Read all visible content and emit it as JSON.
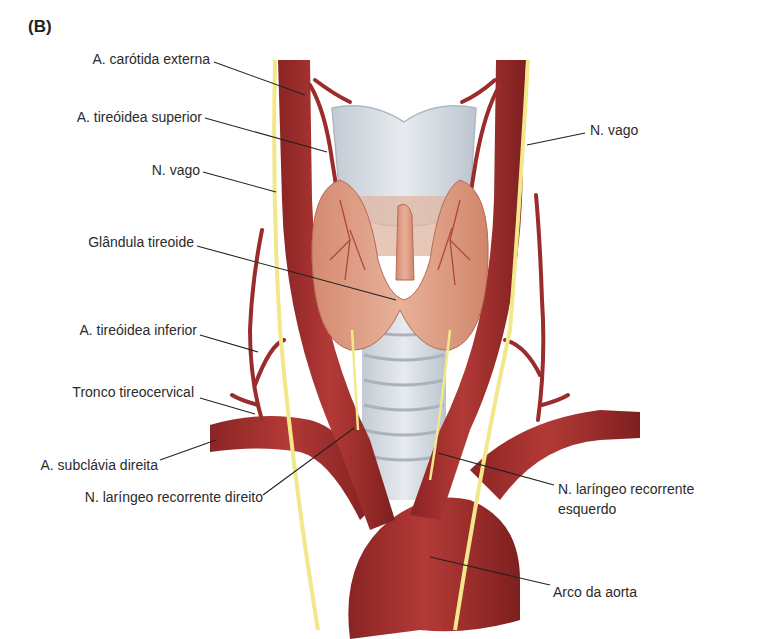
{
  "figure": {
    "panel_letter": "(B)",
    "colors": {
      "artery": "#a8302e",
      "artery_dark": "#7e1f1f",
      "nerve": "#f2e88a",
      "cartilage": "#d7dde3",
      "thyroid": "#dc9a80",
      "leader_line": "#222222"
    },
    "labels_left": [
      {
        "id": "carotida_externa",
        "text": "A. carótida externa"
      },
      {
        "id": "tireoidea_superior",
        "text": "A. tireóidea superior"
      },
      {
        "id": "vago_direito",
        "text": "N. vago"
      },
      {
        "id": "glandula_tireoide",
        "text": "Glândula tireoide"
      },
      {
        "id": "tireoidea_inferior",
        "text": "A. tireóidea inferior"
      },
      {
        "id": "tronco_tireocervical",
        "text": "Tronco tireocervical"
      },
      {
        "id": "subclavia_direita",
        "text": "A. subclávia direita"
      },
      {
        "id": "laringeo_recorrente_direito",
        "text": "N. laríngeo recorrente direito"
      }
    ],
    "labels_right": [
      {
        "id": "vago_esquerdo",
        "text": "N. vago"
      },
      {
        "id": "laringeo_recorrente_esquerdo_l1",
        "text": "N. laríngeo recorrente"
      },
      {
        "id": "laringeo_recorrente_esquerdo_l2",
        "text": "esquerdo"
      },
      {
        "id": "arco_aorta",
        "text": "Arco da aorta"
      }
    ]
  }
}
